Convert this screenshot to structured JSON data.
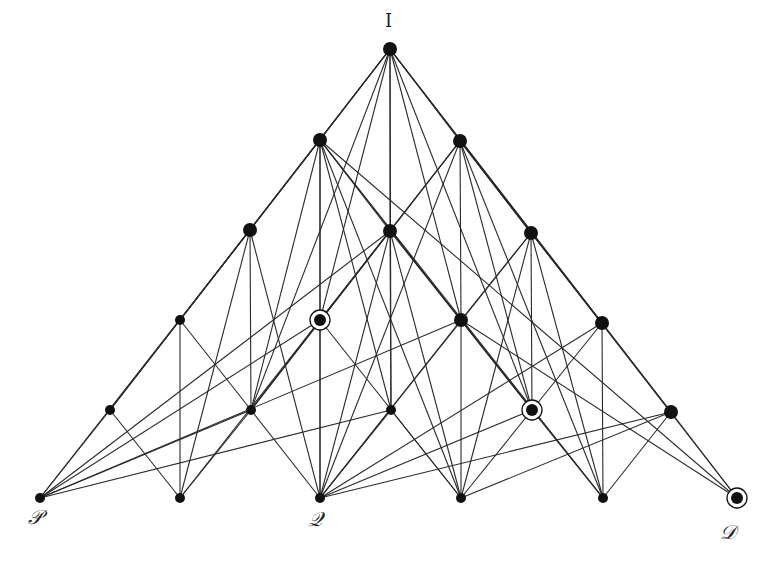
{
  "diagram": {
    "title": "",
    "labels": {
      "top": "I",
      "bottom_left": "𝒫",
      "bottom_middle": "𝒬",
      "bottom_right": "𝒟"
    },
    "colors": {
      "edge": "#2a2a2a",
      "node": "#111111",
      "background": "#ffffff"
    },
    "nodes": [
      {
        "id": "I",
        "x": 390,
        "y": 49,
        "r": 7,
        "ringed": false
      },
      {
        "id": "A",
        "x": 320,
        "y": 140,
        "r": 7,
        "ringed": false
      },
      {
        "id": "B",
        "x": 460,
        "y": 141,
        "r": 7,
        "ringed": false
      },
      {
        "id": "C",
        "x": 250,
        "y": 230,
        "r": 7,
        "ringed": false
      },
      {
        "id": "D",
        "x": 390,
        "y": 231,
        "r": 7,
        "ringed": false
      },
      {
        "id": "E",
        "x": 531,
        "y": 233,
        "r": 7,
        "ringed": false
      },
      {
        "id": "F",
        "x": 180,
        "y": 320,
        "r": 5,
        "ringed": false
      },
      {
        "id": "G",
        "x": 320,
        "y": 320,
        "r": 5,
        "ringed": true
      },
      {
        "id": "H",
        "x": 461,
        "y": 320,
        "r": 7,
        "ringed": false
      },
      {
        "id": "J",
        "x": 602,
        "y": 323,
        "r": 7,
        "ringed": false
      },
      {
        "id": "K",
        "x": 110,
        "y": 410,
        "r": 5,
        "ringed": false
      },
      {
        "id": "L",
        "x": 251,
        "y": 410,
        "r": 5,
        "ringed": false
      },
      {
        "id": "M",
        "x": 391,
        "y": 410,
        "r": 5,
        "ringed": false
      },
      {
        "id": "N",
        "x": 532,
        "y": 410,
        "r": 5,
        "ringed": true
      },
      {
        "id": "O",
        "x": 671,
        "y": 412,
        "r": 7,
        "ringed": false
      },
      {
        "id": "P",
        "x": 40,
        "y": 498,
        "r": 5,
        "ringed": false
      },
      {
        "id": "R",
        "x": 180,
        "y": 498,
        "r": 5,
        "ringed": false
      },
      {
        "id": "Q",
        "x": 320,
        "y": 498,
        "r": 5,
        "ringed": false
      },
      {
        "id": "S",
        "x": 461,
        "y": 498,
        "r": 5,
        "ringed": false
      },
      {
        "id": "T",
        "x": 603,
        "y": 498,
        "r": 5,
        "ringed": false
      },
      {
        "id": "U",
        "x": 737,
        "y": 498,
        "r": 5,
        "ringed": true
      }
    ],
    "edges": [
      [
        "I",
        "A"
      ],
      [
        "I",
        "B"
      ],
      [
        "I",
        "D"
      ],
      [
        "I",
        "F"
      ],
      [
        "I",
        "G"
      ],
      [
        "I",
        "H"
      ],
      [
        "I",
        "J"
      ],
      [
        "I",
        "K"
      ],
      [
        "I",
        "L"
      ],
      [
        "I",
        "M"
      ],
      [
        "I",
        "N"
      ],
      [
        "I",
        "O"
      ],
      [
        "I",
        "C"
      ],
      [
        "I",
        "E"
      ],
      [
        "A",
        "C"
      ],
      [
        "A",
        "D"
      ],
      [
        "A",
        "G"
      ],
      [
        "A",
        "H"
      ],
      [
        "A",
        "L"
      ],
      [
        "A",
        "M"
      ],
      [
        "A",
        "S"
      ],
      [
        "A",
        "T"
      ],
      [
        "A",
        "U"
      ],
      [
        "A",
        "Q"
      ],
      [
        "B",
        "E"
      ],
      [
        "B",
        "D"
      ],
      [
        "B",
        "G"
      ],
      [
        "B",
        "H"
      ],
      [
        "B",
        "J"
      ],
      [
        "B",
        "N"
      ],
      [
        "B",
        "T"
      ],
      [
        "B",
        "U"
      ],
      [
        "B",
        "L"
      ],
      [
        "B",
        "Q"
      ],
      [
        "C",
        "F"
      ],
      [
        "C",
        "K"
      ],
      [
        "C",
        "L"
      ],
      [
        "C",
        "R"
      ],
      [
        "C",
        "Q"
      ],
      [
        "C",
        "P"
      ],
      [
        "D",
        "G"
      ],
      [
        "D",
        "H"
      ],
      [
        "D",
        "M"
      ],
      [
        "D",
        "Q"
      ],
      [
        "D",
        "S"
      ],
      [
        "D",
        "L"
      ],
      [
        "D",
        "N"
      ],
      [
        "D",
        "P"
      ],
      [
        "E",
        "H"
      ],
      [
        "E",
        "J"
      ],
      [
        "E",
        "N"
      ],
      [
        "E",
        "S"
      ],
      [
        "E",
        "T"
      ],
      [
        "E",
        "Q"
      ],
      [
        "F",
        "K"
      ],
      [
        "F",
        "R"
      ],
      [
        "F",
        "L"
      ],
      [
        "G",
        "P"
      ],
      [
        "G",
        "Q"
      ],
      [
        "G",
        "S"
      ],
      [
        "G",
        "L"
      ],
      [
        "G",
        "R"
      ],
      [
        "H",
        "N"
      ],
      [
        "H",
        "Q"
      ],
      [
        "H",
        "S"
      ],
      [
        "H",
        "T"
      ],
      [
        "H",
        "U"
      ],
      [
        "H",
        "P"
      ],
      [
        "J",
        "O"
      ],
      [
        "J",
        "T"
      ],
      [
        "J",
        "Q"
      ],
      [
        "J",
        "N"
      ],
      [
        "K",
        "P"
      ],
      [
        "K",
        "R"
      ],
      [
        "L",
        "P"
      ],
      [
        "L",
        "R"
      ],
      [
        "L",
        "Q"
      ],
      [
        "M",
        "Q"
      ],
      [
        "M",
        "S"
      ],
      [
        "M",
        "P"
      ],
      [
        "N",
        "Q"
      ],
      [
        "N",
        "S"
      ],
      [
        "N",
        "T"
      ],
      [
        "O",
        "U"
      ],
      [
        "O",
        "T"
      ],
      [
        "O",
        "S"
      ],
      [
        "O",
        "Q"
      ]
    ]
  }
}
